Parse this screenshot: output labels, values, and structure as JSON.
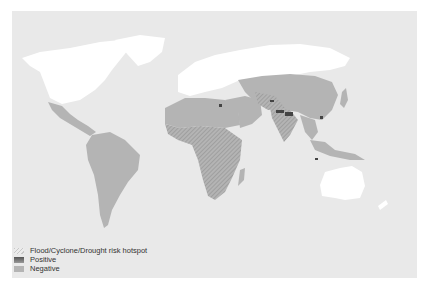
{
  "map": {
    "title": "",
    "projection": "world",
    "background_color": "#e9e9e9",
    "colors": {
      "no_data_land": "#ffffff",
      "negative": "#b4b4b4",
      "positive": "#555555",
      "hotspot_hatch": "#8a8a8a"
    }
  },
  "legend": {
    "items": [
      {
        "key": "hotspot",
        "label": "Flood/Cyclone/Drought risk hotspot",
        "icon": "hatch-icon"
      },
      {
        "key": "positive",
        "label": "Positive",
        "icon": "dark-swatch-icon"
      },
      {
        "key": "negative",
        "label": "Negative",
        "icon": "gray-swatch-icon"
      }
    ]
  },
  "regions": [
    {
      "name": "North America",
      "category": "none"
    },
    {
      "name": "Greenland",
      "category": "none"
    },
    {
      "name": "Europe / Russia",
      "category": "none"
    },
    {
      "name": "Australia",
      "category": "none"
    },
    {
      "name": "Mexico / Central America",
      "category": "negative"
    },
    {
      "name": "South America",
      "category": "negative"
    },
    {
      "name": "North Africa",
      "category": "negative"
    },
    {
      "name": "Sub-Saharan Africa",
      "category": "negative",
      "hotspot": true
    },
    {
      "name": "Middle East",
      "category": "negative",
      "hotspot": true
    },
    {
      "name": "Central Asia / China",
      "category": "negative"
    },
    {
      "name": "South Asia",
      "category": "negative",
      "hotspot": true,
      "positive_spots": true
    },
    {
      "name": "Southeast Asia",
      "category": "negative",
      "positive_spots": true
    }
  ]
}
